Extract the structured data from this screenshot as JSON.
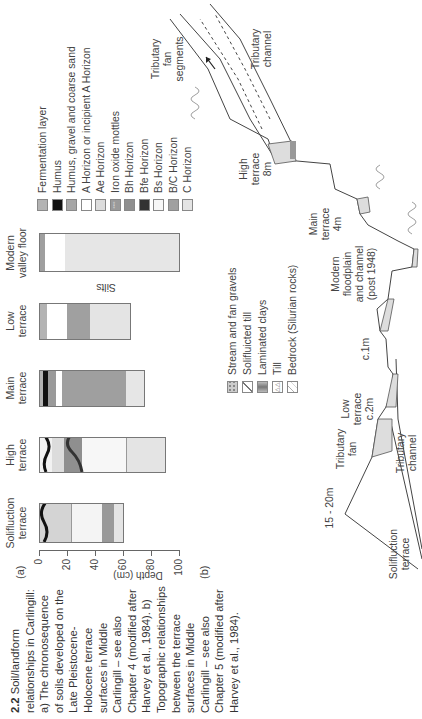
{
  "caption": {
    "number": "2.2",
    "text": "Soil/landform relationships in Carlingill: a) The chronosequence of soils developed on the Late Pleistocene-Holocene terrace surfaces in Middle Carlingill – see also Chapter 4 (modified after Harvey et al., 1984). b) Topographic relationships between the terrace surfaces in Middle Carlingill – see also Chapter 5 (modified after Harvey et al., 1984)."
  },
  "panel_a": {
    "label": "(a)",
    "axis_title": "Depth (cm)",
    "ticks": [
      "0",
      "20",
      "40",
      "60",
      "80",
      "100"
    ],
    "columns": [
      {
        "name": "Solifluction terrace",
        "line1": "Solifluction",
        "line2": "terrace"
      },
      {
        "name": "High terrace",
        "line1": "High",
        "line2": "terrace"
      },
      {
        "name": "Main terrace",
        "line1": "Main",
        "line2": "terrace"
      },
      {
        "name": "Low terrace",
        "line1": "Low",
        "line2": "terrace",
        "note": "Silts"
      },
      {
        "name": "Modern valley floor",
        "line1": "Modern",
        "line2": "valley floor"
      }
    ],
    "legend": [
      {
        "label": "Fermentation layer",
        "color": "#b3b3b3"
      },
      {
        "label": "Humus",
        "color": "#111111"
      },
      {
        "label": "Humus, gravel and coarse sand",
        "color": "#a6a6a6"
      },
      {
        "label": "A Horizon or incipient A Horizon",
        "color": "#ffffff"
      },
      {
        "label": "Ae Horizon",
        "color": "#dcdcdc"
      },
      {
        "label": "Iron oxide mottles",
        "color": "#9a9a9a"
      },
      {
        "label": "Bh Horizon",
        "color": "#8f8f8f"
      },
      {
        "label": "Bfe Horizon",
        "color": "#333333"
      },
      {
        "label": "Bs Horizon",
        "color": "#f7f7f7"
      },
      {
        "label": "B/C Horizon",
        "color": "#a0a0a0"
      },
      {
        "label": "C Horizon",
        "color": "#e4e4e4"
      }
    ]
  },
  "panel_b": {
    "label": "(b)",
    "legend": [
      {
        "label": "Stream and fan gravels"
      },
      {
        "label": "Solifluicted till"
      },
      {
        "label": "Laminated clays"
      },
      {
        "label": "Till"
      },
      {
        "label": "Bedrock (Silurian rocks)"
      }
    ],
    "labels": {
      "solifluction": [
        "Solifluction",
        "terrace"
      ],
      "height_15_20": "15 - 20m",
      "trib_channel_left": [
        "Tributary",
        "channel"
      ],
      "trib_fan_left": [
        "Tributary",
        "fan"
      ],
      "low_terrace": [
        "Low",
        "terrace",
        "c.2m"
      ],
      "c1m": "c.1m",
      "modern": [
        "Modern",
        "floodplain",
        "and channel",
        "(post 1948)"
      ],
      "main_terrace": [
        "Main",
        "terrace",
        "4m"
      ],
      "high_terrace": [
        "High",
        "terrace",
        "8m"
      ],
      "trib_fan_segments": [
        "Tributary",
        "fan",
        "segments"
      ],
      "trib_channel_right": [
        "Tributary",
        "channel"
      ]
    }
  }
}
